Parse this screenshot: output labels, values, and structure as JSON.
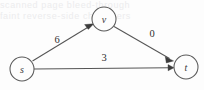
{
  "figure": {
    "type": "directed-graph",
    "width": 204,
    "height": 90,
    "background_color": "#fdfdfd",
    "stroke_color": "#555555",
    "text_color": "#2f2f2f"
  },
  "nodes": [
    {
      "id": "s",
      "label": "s",
      "cx": 22,
      "cy": 69,
      "r": 12
    },
    {
      "id": "v",
      "label": "v",
      "cx": 104,
      "cy": 19,
      "r": 12
    },
    {
      "id": "t",
      "label": "t",
      "cx": 186,
      "cy": 67,
      "r": 12
    }
  ],
  "edges": [
    {
      "id": "s-v",
      "from": "s",
      "to": "v",
      "weight": "6",
      "label_x": 57,
      "label_y": 39
    },
    {
      "id": "v-t",
      "from": "v",
      "to": "t",
      "weight": "0",
      "label_x": 152,
      "label_y": 33
    },
    {
      "id": "s-t",
      "from": "s",
      "to": "t",
      "weight": "3",
      "label_x": 104,
      "label_y": 57
    }
  ],
  "artifacts": {
    "ghost_text_line_1": "scanned page bleed-through",
    "ghost_text_line_2": "faint reverse-side characters"
  }
}
